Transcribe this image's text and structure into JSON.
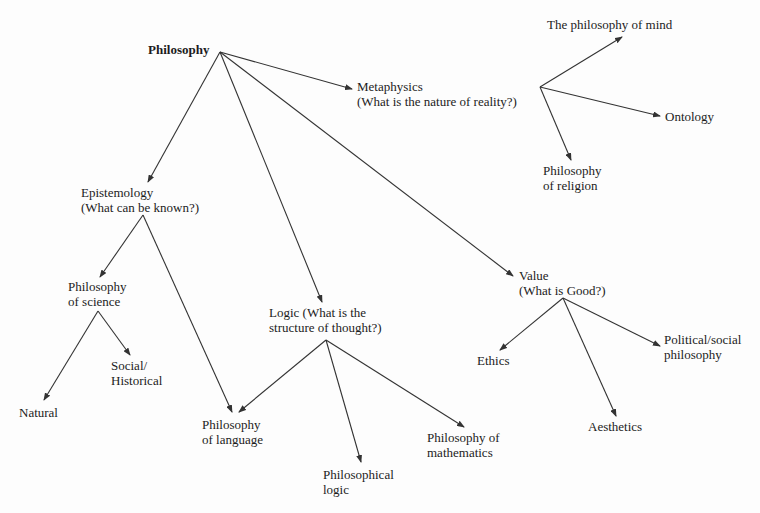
{
  "diagram": {
    "title": "Philosophy",
    "type": "tree",
    "nodes": {
      "philosophy": {
        "lines": [
          "Philosophy"
        ]
      },
      "metaphysics": {
        "lines": [
          "Metaphysics",
          "(What is the nature of reality?)"
        ]
      },
      "mind": {
        "lines": [
          "The philosophy of mind"
        ]
      },
      "ontology": {
        "lines": [
          "Ontology"
        ]
      },
      "religion": {
        "lines": [
          "Philosophy",
          "of religion"
        ]
      },
      "epistemology": {
        "lines": [
          "Epistemology",
          "(What can be known?)"
        ]
      },
      "science": {
        "lines": [
          "Philosophy",
          "of science"
        ]
      },
      "social": {
        "lines": [
          "Social/",
          "Historical"
        ]
      },
      "natural": {
        "lines": [
          "Natural"
        ]
      },
      "language": {
        "lines": [
          "Philosophy",
          "of language"
        ]
      },
      "logic": {
        "lines": [
          "Logic (What is the",
          "structure of thought?)"
        ]
      },
      "philological": {
        "lines": [
          "Philosophical",
          "logic"
        ]
      },
      "mathematics": {
        "lines": [
          "Philosophy of",
          "mathematics"
        ]
      },
      "value": {
        "lines": [
          "Value",
          "(What is Good?)"
        ]
      },
      "ethics": {
        "lines": [
          "Ethics"
        ]
      },
      "aesthetics": {
        "lines": [
          "Aesthetics"
        ]
      },
      "political": {
        "lines": [
          "Political/social",
          "philosophy"
        ]
      }
    },
    "edges": [
      {
        "from": "philosophy",
        "to": "metaphysics",
        "x1": 220,
        "y1": 52,
        "x2": 352,
        "y2": 89
      },
      {
        "from": "philosophy",
        "to": "epistemology",
        "x1": 220,
        "y1": 52,
        "x2": 148,
        "y2": 182
      },
      {
        "from": "philosophy",
        "to": "logic",
        "x1": 220,
        "y1": 52,
        "x2": 322,
        "y2": 302
      },
      {
        "from": "philosophy",
        "to": "value",
        "x1": 220,
        "y1": 52,
        "x2": 513,
        "y2": 276
      },
      {
        "from": "metaphysics",
        "to": "mind",
        "x1": 540,
        "y1": 87,
        "x2": 622,
        "y2": 37
      },
      {
        "from": "metaphysics",
        "to": "ontology",
        "x1": 540,
        "y1": 87,
        "x2": 660,
        "y2": 116
      },
      {
        "from": "metaphysics",
        "to": "religion",
        "x1": 540,
        "y1": 87,
        "x2": 571,
        "y2": 160
      },
      {
        "from": "epistemology",
        "to": "science",
        "x1": 143,
        "y1": 215,
        "x2": 100,
        "y2": 277
      },
      {
        "from": "epistemology",
        "to": "language",
        "x1": 143,
        "y1": 215,
        "x2": 232,
        "y2": 412
      },
      {
        "from": "science",
        "to": "social",
        "x1": 98,
        "y1": 311,
        "x2": 130,
        "y2": 355
      },
      {
        "from": "science",
        "to": "natural",
        "x1": 98,
        "y1": 311,
        "x2": 44,
        "y2": 400
      },
      {
        "from": "logic",
        "to": "language",
        "x1": 326,
        "y1": 340,
        "x2": 239,
        "y2": 412
      },
      {
        "from": "logic",
        "to": "philological",
        "x1": 326,
        "y1": 340,
        "x2": 361,
        "y2": 462
      },
      {
        "from": "logic",
        "to": "mathematics",
        "x1": 326,
        "y1": 340,
        "x2": 464,
        "y2": 427
      },
      {
        "from": "value",
        "to": "ethics",
        "x1": 563,
        "y1": 298,
        "x2": 500,
        "y2": 350
      },
      {
        "from": "value",
        "to": "aesthetics",
        "x1": 563,
        "y1": 298,
        "x2": 616,
        "y2": 416
      },
      {
        "from": "value",
        "to": "political",
        "x1": 563,
        "y1": 298,
        "x2": 660,
        "y2": 346
      }
    ]
  },
  "colors": {
    "line": "#333333",
    "text": "#1c1c1c",
    "background": "#fdfdfd"
  }
}
